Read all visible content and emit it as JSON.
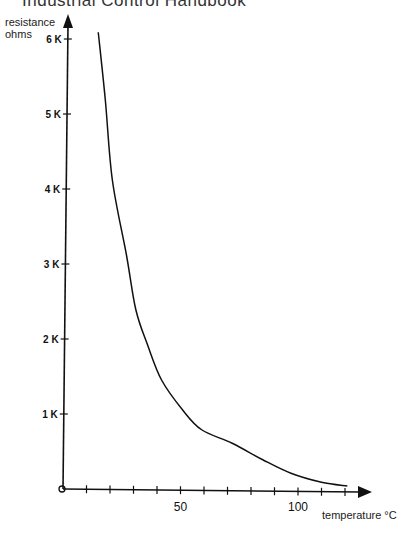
{
  "header": {
    "title": "Industrial Control Handbook"
  },
  "chart_data": {
    "type": "line",
    "title": "",
    "xlabel": "temperature °C",
    "ylabel": "resistance ohms",
    "x_tick_labels": [
      "0",
      "50",
      "100"
    ],
    "x_tick_step": 10,
    "x_ticks": [
      0,
      10,
      20,
      30,
      40,
      50,
      60,
      70,
      80,
      90,
      100,
      110,
      120
    ],
    "y_tick_labels": [
      "1K",
      "2K",
      "3K",
      "4K",
      "5K",
      "6K"
    ],
    "y_ticks": [
      1000,
      2000,
      3000,
      4000,
      5000,
      6000
    ],
    "xlim": [
      0,
      128
    ],
    "ylim": [
      0,
      6300
    ],
    "grid": false,
    "legend": null,
    "series": [
      {
        "name": "thermistor resistance",
        "x": [
          15,
          18,
          21,
          27,
          31,
          36,
          42,
          51,
          59,
          72,
          85,
          97,
          110,
          121
        ],
        "values": [
          6090,
          5190,
          4120,
          3120,
          2390,
          1920,
          1450,
          1050,
          790,
          610,
          390,
          210,
          90,
          40
        ]
      }
    ]
  }
}
